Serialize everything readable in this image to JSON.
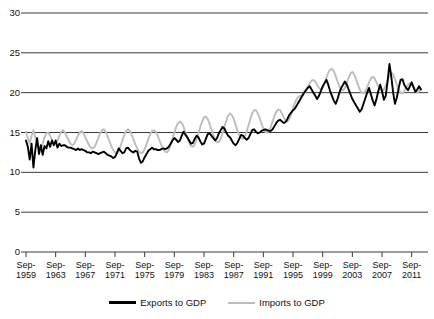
{
  "chart_data": {
    "type": "line",
    "title": "",
    "xlabel": "",
    "ylabel": "",
    "ylim": [
      0,
      30
    ],
    "y_ticks": [
      0,
      5,
      10,
      15,
      20,
      25,
      30
    ],
    "grid": true,
    "legend_position": "bottom",
    "x_tick_labels": [
      "Sep-1959",
      "Sep-1963",
      "Sep-1967",
      "Sep-1971",
      "Sep-1975",
      "Sep-1979",
      "Sep-1983",
      "Sep-1987",
      "Sep-1991",
      "Sep-1995",
      "Sep-1999",
      "Sep-2003",
      "Sep-2007",
      "Sep-2011"
    ],
    "x_tick_months": [
      "Sep-",
      "Sep-",
      "Sep-",
      "Sep-",
      "Sep-",
      "Sep-",
      "Sep-",
      "Sep-",
      "Sep-",
      "Sep-",
      "Sep-",
      "Sep-",
      "Sep-",
      "Sep-"
    ],
    "x_tick_years": [
      "1959",
      "1963",
      "1967",
      "1971",
      "1975",
      "1979",
      "1983",
      "1987",
      "1991",
      "1995",
      "1999",
      "2003",
      "2007",
      "2011"
    ],
    "x_start": "Sep-1959",
    "x_end": "Sep-2012",
    "x_interval": "quarterly",
    "x_points": 214,
    "colors": {
      "exports": "#000000",
      "imports": "#bdbdbd",
      "grid": "#3a3a3a",
      "axis": "#3a3a3a",
      "background": "#ffffff"
    },
    "series": [
      {
        "name": "Exports to GDP",
        "color": "#000000",
        "values": [
          14.0,
          13.2,
          11.6,
          13.6,
          10.6,
          12.8,
          14.3,
          12.3,
          13.4,
          12.2,
          13.3,
          13.0,
          13.9,
          13.2,
          14.0,
          13.4,
          14.0,
          13.1,
          13.6,
          13.3,
          13.4,
          13.4,
          13.2,
          13.1,
          13.1,
          13.0,
          12.9,
          12.8,
          13.0,
          12.8,
          12.9,
          12.8,
          12.7,
          12.5,
          12.5,
          12.4,
          12.6,
          12.5,
          12.4,
          12.3,
          12.4,
          12.5,
          12.6,
          12.4,
          12.2,
          12.1,
          12.0,
          11.8,
          11.9,
          12.4,
          13.0,
          12.7,
          12.4,
          12.5,
          13.0,
          13.1,
          12.8,
          12.6,
          12.5,
          12.7,
          12.6,
          11.7,
          11.2,
          11.4,
          11.9,
          12.3,
          12.7,
          12.9,
          13.1,
          12.9,
          12.9,
          12.8,
          12.8,
          12.9,
          13.0,
          12.9,
          13.0,
          13.2,
          13.6,
          14.0,
          14.3,
          14.1,
          13.8,
          14.0,
          14.6,
          15.1,
          14.7,
          14.4,
          14.0,
          13.6,
          13.7,
          14.2,
          14.6,
          14.4,
          13.9,
          13.5,
          13.6,
          14.2,
          14.8,
          14.9,
          14.6,
          14.3,
          14.0,
          14.3,
          14.9,
          15.3,
          15.7,
          15.5,
          15.0,
          14.6,
          14.4,
          14.0,
          13.6,
          13.4,
          13.7,
          14.2,
          14.7,
          14.6,
          14.3,
          14.1,
          14.3,
          14.8,
          15.3,
          15.4,
          15.1,
          14.9,
          15.0,
          15.2,
          15.3,
          15.4,
          15.3,
          15.2,
          15.2,
          15.4,
          15.8,
          16.2,
          16.5,
          16.6,
          16.4,
          16.2,
          16.3,
          16.7,
          17.2,
          17.5,
          17.8,
          18.0,
          18.4,
          18.8,
          19.2,
          19.6,
          20.0,
          20.3,
          20.6,
          20.8,
          20.4,
          20.0,
          19.6,
          19.2,
          19.6,
          20.2,
          20.8,
          21.2,
          21.6,
          21.0,
          20.2,
          19.6,
          19.0,
          18.6,
          19.2,
          20.0,
          20.6,
          21.0,
          21.4,
          21.0,
          20.4,
          19.8,
          19.2,
          18.8,
          18.4,
          18.0,
          17.6,
          17.9,
          18.6,
          19.3,
          20.0,
          20.6,
          19.8,
          19.0,
          18.4,
          19.2,
          20.2,
          21.0,
          20.2,
          19.1,
          19.6,
          21.4,
          23.6,
          22.0,
          20.0,
          18.6,
          19.4,
          20.6,
          21.6,
          21.7,
          21.0,
          20.6,
          20.3,
          20.8,
          21.3,
          20.7,
          20.1,
          20.4,
          20.8,
          20.4
        ]
      },
      {
        "name": "Imports to GDP",
        "color": "#bdbdbd",
        "values": [
          15.1,
          14.3,
          13.6,
          14.6,
          15.3,
          14.4,
          13.6,
          13.0,
          12.9,
          13.6,
          14.4,
          14.9,
          15.0,
          14.6,
          14.1,
          13.7,
          13.6,
          14.0,
          14.6,
          15.1,
          15.3,
          15.0,
          14.5,
          14.0,
          13.6,
          13.4,
          13.6,
          14.1,
          14.6,
          15.0,
          15.2,
          14.9,
          14.4,
          13.9,
          13.4,
          13.1,
          13.0,
          13.2,
          13.7,
          14.3,
          14.9,
          15.3,
          15.4,
          15.1,
          14.5,
          13.9,
          13.3,
          12.8,
          12.5,
          12.4,
          12.7,
          13.3,
          14.0,
          14.7,
          15.2,
          15.4,
          15.2,
          14.7,
          14.1,
          13.5,
          13.0,
          12.6,
          12.4,
          12.5,
          12.9,
          13.5,
          14.2,
          14.8,
          15.2,
          15.3,
          15.1,
          14.6,
          14.0,
          13.4,
          12.9,
          12.6,
          12.5,
          12.8,
          13.4,
          14.2,
          15.0,
          15.7,
          16.2,
          16.4,
          16.2,
          15.7,
          15.0,
          14.3,
          13.7,
          13.3,
          13.2,
          13.5,
          14.1,
          14.9,
          15.7,
          16.4,
          16.9,
          17.0,
          16.7,
          16.1,
          15.4,
          14.7,
          14.1,
          13.8,
          13.8,
          14.2,
          14.9,
          15.7,
          16.5,
          17.1,
          17.4,
          17.2,
          16.7,
          16.0,
          15.3,
          14.7,
          14.3,
          14.2,
          14.5,
          15.1,
          15.9,
          16.7,
          17.4,
          17.8,
          17.8,
          17.4,
          16.8,
          16.1,
          15.5,
          15.1,
          15.0,
          15.2,
          15.7,
          16.4,
          17.1,
          17.6,
          17.9,
          17.8,
          17.4,
          16.9,
          16.5,
          16.4,
          16.7,
          17.3,
          18.0,
          18.7,
          19.2,
          19.5,
          19.6,
          19.7,
          20.0,
          20.4,
          20.8,
          21.2,
          21.5,
          21.6,
          21.4,
          21.0,
          20.6,
          20.4,
          20.6,
          21.2,
          21.9,
          22.5,
          22.9,
          23.0,
          22.7,
          22.1,
          21.4,
          20.8,
          20.4,
          20.3,
          20.6,
          21.2,
          21.9,
          22.4,
          22.6,
          22.3,
          21.7,
          21.0,
          20.4,
          20.0,
          19.9,
          20.2,
          20.7,
          21.3,
          21.8,
          22.0,
          21.8,
          21.3,
          20.8,
          20.4,
          20.2,
          20.4,
          20.9,
          21.6,
          22.2,
          22.5,
          22.3,
          21.7,
          21.0,
          20.4,
          20.0,
          19.9,
          20.2,
          20.6,
          21.0,
          21.2,
          21.0,
          20.6,
          20.2,
          20.0,
          20.2,
          20.5
        ]
      }
    ]
  },
  "legend": {
    "entries": [
      {
        "label": "Exports to GDP"
      },
      {
        "label": "Imports to GDP"
      }
    ]
  }
}
